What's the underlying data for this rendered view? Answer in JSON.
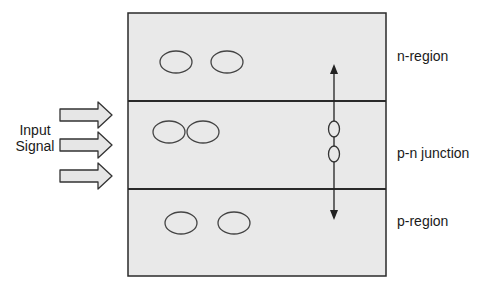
{
  "diagram": {
    "type": "p-n junction schematic",
    "input": {
      "label_line1": "Input",
      "label_line2": "Signal",
      "arrow_count": 3
    },
    "regions": [
      {
        "id": "n",
        "label": "n-region",
        "carrier_ellipses": 2
      },
      {
        "id": "pn",
        "label": "p-n junction",
        "carrier_ellipses": 2,
        "vertical_ellipses": 2
      },
      {
        "id": "p",
        "label": "p-region",
        "carrier_ellipses": 2
      }
    ],
    "vertical_arrow": "double-headed, spanning n-region to p-region through junction",
    "colors": {
      "fill": "#e9e9e9",
      "stroke": "#2a2a2a",
      "arrow_fill": "#e6e6e6"
    }
  }
}
